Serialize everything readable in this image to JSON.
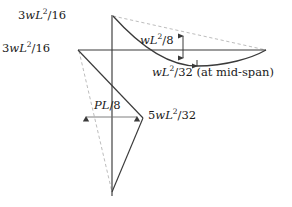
{
  "figure": {
    "colors": {
      "solid_line": "#3a3a3a",
      "dashed_line": "#b9b9b9",
      "text": "#1a1a1a",
      "background": "#ffffff"
    },
    "labels": {
      "top_left": {
        "pre": "3",
        "var1": "w",
        "var2": "L",
        "exp": "2",
        "post": "/16"
      },
      "mid_left": {
        "pre": "3",
        "var1": "w",
        "var2": "L",
        "exp": "2",
        "post": "/16"
      },
      "wl8": {
        "pre": "",
        "var1": "w",
        "var2": "L",
        "exp": "2",
        "post": "/8"
      },
      "wl32": {
        "pre": "",
        "var1": "w",
        "var2": "L",
        "exp": "2",
        "post": "/32 (at mid-span)"
      },
      "pl8": {
        "pre": "",
        "var1": "P",
        "var2": "L",
        "exp": "",
        "post": "/8"
      },
      "five_wl32": {
        "pre": "5",
        "var1": "w",
        "var2": "L",
        "exp": "2",
        "post": "/32"
      }
    },
    "label_text": {
      "top_left": "3wL^2/16",
      "mid_left": "3wL^2/16",
      "wl8": "wL^2/8",
      "wl32": "wL^2/32 (at mid-span)",
      "pl8": "PL/8",
      "five_wl32": "5wL^2/32"
    },
    "geometry": {
      "baseline": {
        "x1": 78,
        "y1": 50,
        "x2": 266,
        "y2": 50
      },
      "vertical_axis": {
        "x": 112,
        "y1": 15,
        "y2": 196
      },
      "peak_top": {
        "x": 113,
        "y": 15
      },
      "bottom_vertex": {
        "x": 112,
        "y": 192
      },
      "right_end": {
        "x": 266,
        "y": 50
      },
      "curve_min": {
        "x": 197,
        "y": 66
      },
      "arrow_v": {
        "x": 183,
        "y_top": 30,
        "y_bottom": 64
      },
      "arrow_h": {
        "y": 117,
        "x_left": 80,
        "x_right": 143
      },
      "tri_right_vertex": {
        "x": 143,
        "y": 118
      }
    }
  }
}
